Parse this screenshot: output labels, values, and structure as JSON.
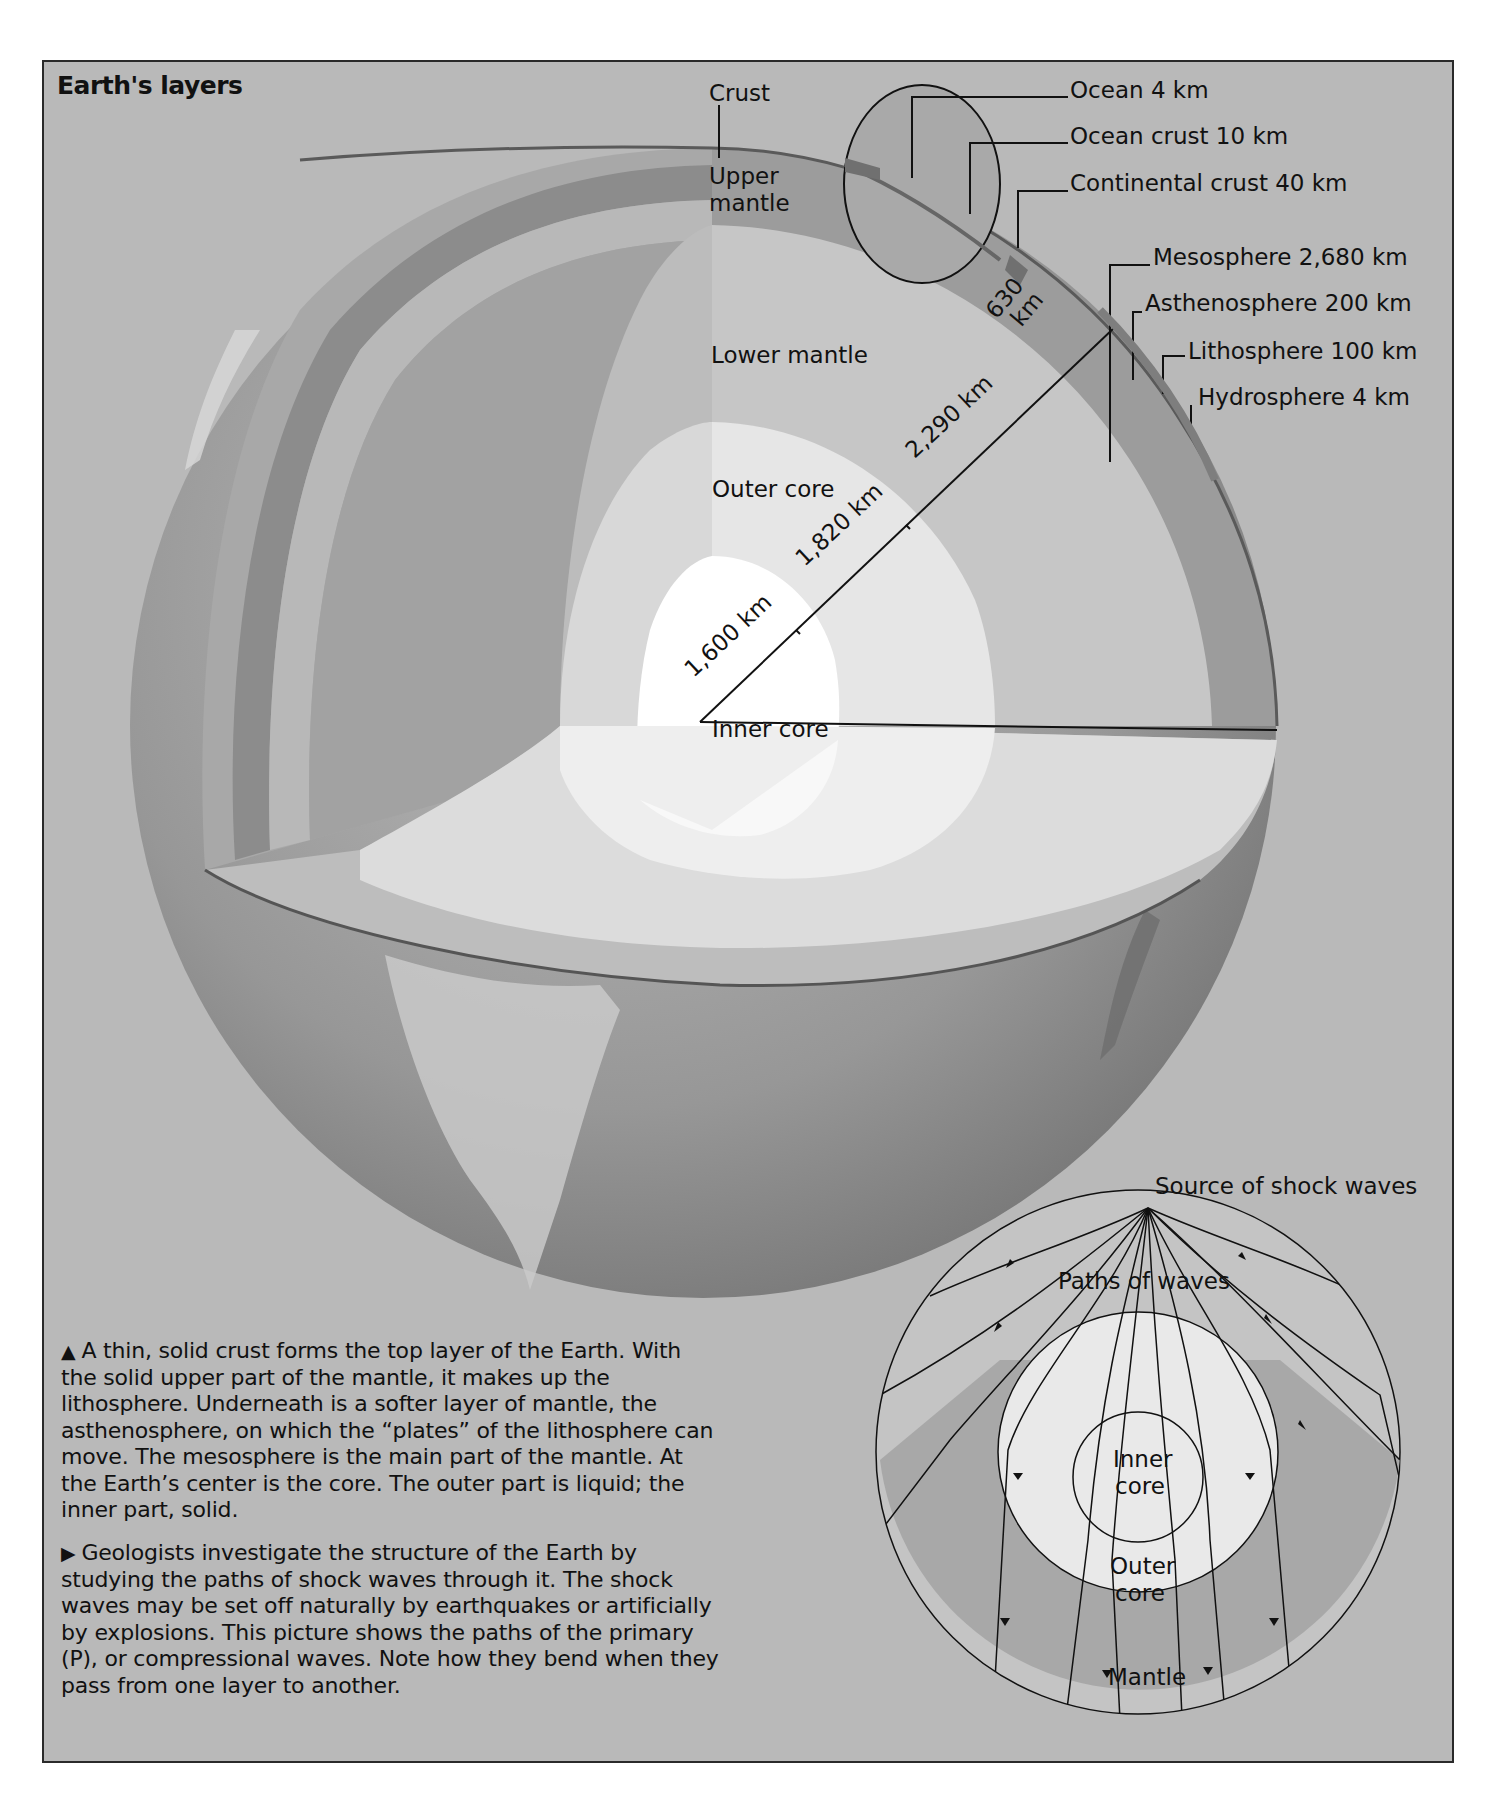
{
  "title": "Earth's layers",
  "main_diagram": {
    "layer_labels": {
      "crust": "Crust",
      "upper_mantle_line1": "Upper",
      "upper_mantle_line2": "mantle",
      "lower_mantle": "Lower mantle",
      "outer_core": "Outer core",
      "inner_core": "Inner core"
    },
    "radial_measurements": {
      "upper_mantle": "630 km",
      "upper_mantle_line1": "630",
      "upper_mantle_line2": "km",
      "lower_mantle": "2,290 km",
      "outer_core": "1,820 km",
      "inner_core": "1,600 km"
    },
    "inset_callouts": [
      {
        "label": "Ocean 4 km"
      },
      {
        "label": "Ocean crust 10 km"
      },
      {
        "label": "Continental crust 40 km"
      }
    ],
    "sphere_callouts": [
      {
        "label": "Mesosphere 2,680 km"
      },
      {
        "label": "Asthenosphere 200 km"
      },
      {
        "label": "Lithosphere 100 km"
      },
      {
        "label": "Hydrosphere 4 km"
      }
    ]
  },
  "wave_diagram": {
    "source_label": "Source of shock waves",
    "paths_label": "Paths of waves",
    "inner_core_line1": "Inner",
    "inner_core_line2": "core",
    "outer_core_line1": "Outer",
    "outer_core_line2": "core",
    "mantle_label": "Mantle"
  },
  "captions": {
    "layers": {
      "marker": "▲",
      "text": "A thin, solid crust forms the top layer of the Earth. With the solid upper part of the mantle, it makes up the lithosphere. Underneath is a softer layer of mantle, the asthenosphere, on which the “plates” of the lithosphere can move. The mesosphere is the main part of the mantle. At the Earth’s center is the core. The outer part is liquid; the inner part, solid."
    },
    "waves": {
      "marker": "▶",
      "text": "Geologists investigate the structure of the Earth by studying the paths of shock waves through it. The shock waves may be set off naturally by earthquakes or artificially by explosions. This picture shows the paths of the primary (P), or compressional waves. Note how they bend when they pass from one layer to another."
    }
  },
  "colors": {
    "background": "#b9b9b9",
    "frame_border": "#2a2a2a",
    "globe_surface": "#8f8f8f",
    "upper_mantle": "#9c9c9c",
    "lower_mantle": "#c4c4c4",
    "outer_core": "#e4e4e4",
    "inner_core": "#ffffff",
    "line": "#111111"
  }
}
